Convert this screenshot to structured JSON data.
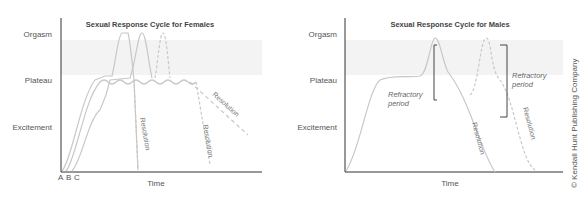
{
  "female_chart": {
    "title": "Sexual Response Cycle for Females",
    "y_labels": [
      "Orgasm",
      "Plateau",
      "Excitement"
    ],
    "x_label": "Time",
    "curve_labels": [
      "A",
      "B",
      "C"
    ],
    "annotations": [
      "Resolution",
      "Resolution",
      "Resolution"
    ]
  },
  "male_chart": {
    "title": "Sexual Response Cycle for Males",
    "y_labels": [
      "Orgasm",
      "Plateau",
      "Excitement"
    ],
    "x_label": "Time",
    "annotations": [
      "Refractory",
      "period",
      "Refractory",
      "period",
      "Resolution",
      "Resolution"
    ]
  },
  "copyright": "© Kendall Hunt Publishing Company",
  "colors": {
    "band": "#f3f3f3",
    "curve": "#c8c8c8",
    "axis": "#333333"
  }
}
